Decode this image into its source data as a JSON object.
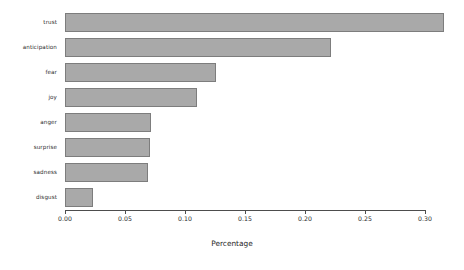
{
  "chart_data": {
    "type": "bar",
    "orientation": "horizontal",
    "title": "",
    "xlabel": "Percentage",
    "ylabel": "",
    "categories": [
      "trust",
      "anticipation",
      "fear",
      "joy",
      "anger",
      "surprise",
      "sadness",
      "disgust"
    ],
    "values": [
      0.316,
      0.222,
      0.126,
      0.11,
      0.072,
      0.071,
      0.069,
      0.023
    ],
    "xlim": [
      0.0,
      0.32
    ],
    "xticks": [
      0.0,
      0.05,
      0.1,
      0.15,
      0.2,
      0.25,
      0.3
    ],
    "xtick_labels": [
      "0.00",
      "0.05",
      "0.10",
      "0.15",
      "0.20",
      "0.25",
      "0.30"
    ],
    "grid": false,
    "legend": null,
    "bar_color": "#a9a9a9",
    "bar_edge_color": "#7d7d7d",
    "axis_color": "#4d4d4d",
    "background": "#ffffff"
  },
  "axis": {
    "x_title": "Percentage"
  }
}
